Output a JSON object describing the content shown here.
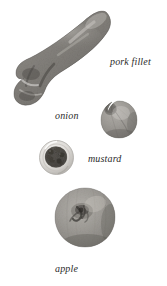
{
  "plate": {
    "title": "ingredients plate",
    "background_color": "#ffffff",
    "palette": {
      "ink": "#2b2b2b",
      "meat_dark": "#4a4845",
      "meat_mid": "#7d7a75",
      "meat_light": "#a8a5a0",
      "onion_dark": "#6e6c68",
      "onion_mid": "#96938e",
      "onion_light": "#c2bfba",
      "mustard_seed": "#4d4a46",
      "mustard_bowl": "#d8d6d2",
      "apple_dark": "#6b6964",
      "apple_mid": "#8f8d88",
      "apple_light": "#b9b7b2"
    },
    "items": [
      {
        "id": "pork-fillet",
        "label": "pork fillet",
        "icon": "pork-fillet-photo",
        "shape": "elongated-curved-loin",
        "label_position": "right"
      },
      {
        "id": "onion",
        "label": "onion",
        "icon": "onion-photo",
        "shape": "round-bulb-with-stem",
        "label_position": "left"
      },
      {
        "id": "mustard",
        "label": "mustard",
        "icon": "mustard-bowl-photo",
        "shape": "small-glass-dish-with-seeds",
        "label_position": "right"
      },
      {
        "id": "apple",
        "label": "apple",
        "icon": "apple-photo",
        "shape": "round-fruit-with-stem-well",
        "label_position": "below"
      }
    ]
  }
}
